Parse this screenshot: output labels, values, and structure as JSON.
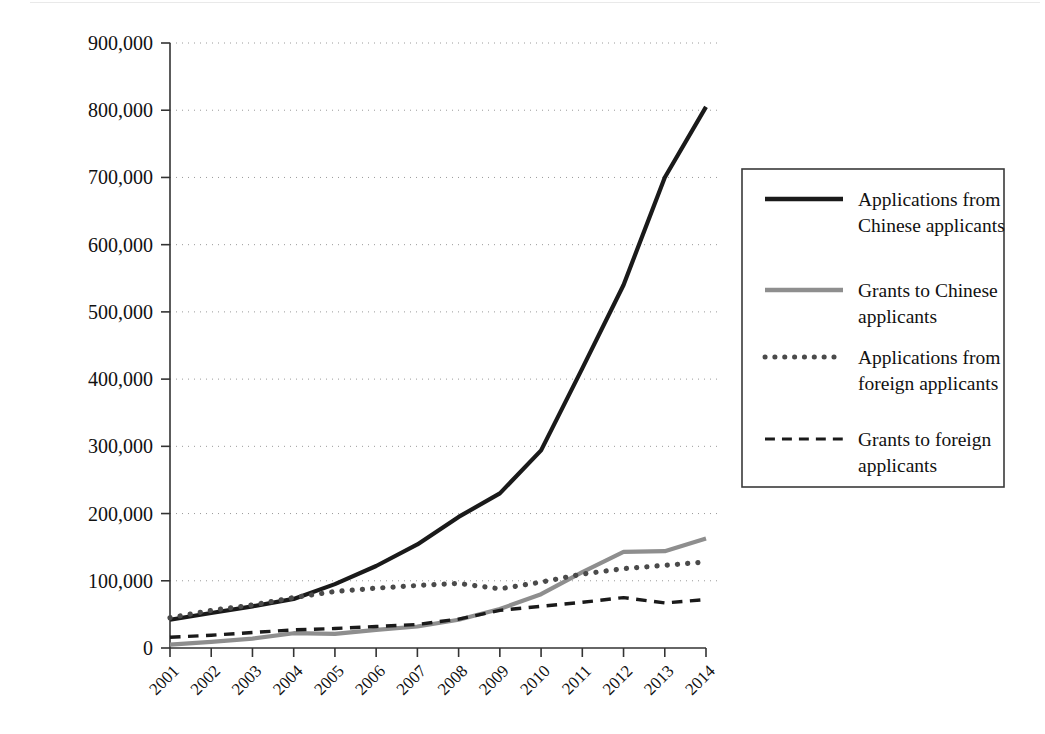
{
  "chart_data": {
    "type": "line",
    "title": "",
    "subtitle": "",
    "xlabel": "",
    "ylabel": "",
    "x": [
      "2001",
      "2002",
      "2003",
      "2004",
      "2005",
      "2006",
      "2007",
      "2008",
      "2009",
      "2010",
      "2011",
      "2012",
      "2013",
      "2014"
    ],
    "categories": [
      "2001",
      "2002",
      "2003",
      "2004",
      "2005",
      "2006",
      "2007",
      "2008",
      "2009",
      "2010",
      "2011",
      "2012",
      "2013",
      "2014"
    ],
    "xtick_labels": [
      "2001",
      "2002",
      "2003",
      "2004",
      "2005",
      "2006",
      "2007",
      "2008",
      "2009",
      "2010",
      "2011",
      "2012",
      "2013",
      "2014"
    ],
    "ytick_labels": [
      "0",
      "100,000",
      "200,000",
      "300,000",
      "400,000",
      "500,000",
      "600,000",
      "700,000",
      "800,000",
      "900,000"
    ],
    "ytick_values": [
      0,
      100000,
      200000,
      300000,
      400000,
      500000,
      600000,
      700000,
      800000,
      900000
    ],
    "ylim": [
      0,
      900000
    ],
    "xlim": [
      "2001",
      "2014"
    ],
    "grid": "horizontal-dotted",
    "legend_position": "right",
    "series": [
      {
        "name": "Applications from Chinese applicants",
        "label_line1": "Applications from",
        "label_line2": "Chinese applicants",
        "style": "solid",
        "color": "#1a1a1a",
        "width": 4.2,
        "values": [
          42000,
          52000,
          62000,
          73000,
          95000,
          122000,
          154000,
          195000,
          230000,
          294000,
          416000,
          540000,
          700000,
          805000
        ]
      },
      {
        "name": "Grants to Chinese applicants",
        "label_line1": "Grants to Chinese",
        "label_line2": "applicants",
        "style": "solid",
        "color": "#8e8e8e",
        "width": 4.2,
        "values": [
          5000,
          9000,
          14000,
          22000,
          21000,
          27000,
          32000,
          42000,
          58000,
          80000,
          113000,
          143000,
          144000,
          163000
        ]
      },
      {
        "name": "Applications from foreign applicants",
        "label_line1": "Applications from",
        "label_line2": "foreign applicants",
        "style": "dotted",
        "color": "#4a4a4a",
        "width": 5.2,
        "values": [
          45000,
          56000,
          64000,
          75000,
          84000,
          89000,
          93000,
          96000,
          88000,
          98000,
          110000,
          118000,
          123000,
          128000
        ]
      },
      {
        "name": "Grants to foreign applicants",
        "label_line1": "Grants to foreign",
        "label_line2": "applicants",
        "style": "dashed",
        "color": "#1a1a1a",
        "width": 3.4,
        "values": [
          16000,
          19000,
          23000,
          27000,
          29000,
          32000,
          35000,
          43000,
          56000,
          62000,
          68000,
          75000,
          67000,
          72000
        ]
      }
    ]
  },
  "axes": {
    "y_axis_name": "y-axis",
    "x_axis_name": "x-axis"
  },
  "legend": {
    "entries": [
      {
        "label_line1": "Applications from",
        "label_line2": "Chinese applicants",
        "style": "solid",
        "color": "#1a1a1a"
      },
      {
        "label_line1": "Grants to Chinese",
        "label_line2": "applicants",
        "style": "solid",
        "color": "#8e8e8e"
      },
      {
        "label_line1": "Applications from",
        "label_line2": "foreign applicants",
        "style": "dotted",
        "color": "#4a4a4a"
      },
      {
        "label_line1": "Grants to foreign",
        "label_line2": "applicants",
        "style": "dashed",
        "color": "#1a1a1a"
      }
    ]
  },
  "colors": {
    "chinese_applications": "#1a1a1a",
    "chinese_grants": "#8e8e8e",
    "foreign_applications": "#4a4a4a",
    "foreign_grants": "#1a1a1a",
    "axis": "#333333",
    "grid": "#9a9a9a",
    "background": "#ffffff"
  }
}
